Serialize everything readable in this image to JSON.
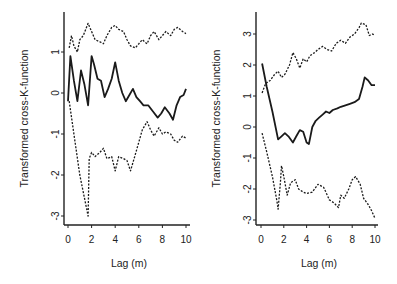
{
  "chart_data": [
    {
      "type": "line",
      "title": "",
      "xlabel": "Lag (m)",
      "ylabel": "Transformed cross-K-function",
      "xlim": [
        0,
        10
      ],
      "ylim": [
        -3.2,
        1.9
      ],
      "xticks": [
        0,
        2,
        4,
        6,
        8,
        10
      ],
      "yticks": [
        -3,
        -2,
        -1,
        0,
        1
      ],
      "grid": false,
      "legend": null,
      "series": [
        {
          "name": "upper envelope",
          "style": "dotted",
          "x": [
            0.1,
            0.3,
            0.5,
            0.8,
            1.0,
            1.3,
            1.7,
            2.0,
            2.3,
            2.7,
            3.0,
            3.3,
            3.7,
            4.0,
            4.3,
            4.7,
            5.0,
            5.3,
            5.7,
            6.0,
            6.3,
            6.7,
            7.0,
            7.3,
            7.7,
            8.0,
            8.3,
            8.7,
            9.0,
            9.3,
            9.7,
            10.0
          ],
          "y": [
            1.1,
            1.4,
            1.15,
            1.0,
            1.3,
            1.4,
            1.7,
            1.5,
            1.3,
            1.25,
            1.2,
            1.4,
            1.6,
            1.65,
            1.55,
            1.5,
            1.3,
            1.15,
            1.1,
            1.2,
            1.3,
            1.2,
            1.4,
            1.5,
            1.3,
            1.4,
            1.5,
            1.4,
            1.55,
            1.6,
            1.5,
            1.45
          ]
        },
        {
          "name": "observed",
          "style": "solid",
          "x": [
            0.0,
            0.2,
            0.5,
            0.8,
            1.1,
            1.4,
            1.7,
            2.0,
            2.2,
            2.5,
            2.8,
            3.1,
            3.4,
            3.7,
            4.0,
            4.3,
            4.6,
            4.9,
            5.2,
            5.5,
            5.8,
            6.1,
            6.4,
            6.8,
            7.2,
            7.6,
            7.9,
            8.2,
            8.6,
            8.9,
            9.2,
            9.5,
            9.8,
            10.0
          ],
          "y": [
            -0.2,
            0.9,
            0.3,
            -0.2,
            0.55,
            0.2,
            -0.3,
            0.9,
            0.7,
            0.35,
            0.3,
            -0.1,
            0.1,
            0.35,
            0.75,
            0.3,
            0.0,
            -0.2,
            -0.05,
            0.1,
            -0.1,
            -0.2,
            -0.3,
            -0.3,
            -0.45,
            -0.6,
            -0.5,
            -0.35,
            -0.5,
            -0.65,
            -0.3,
            -0.1,
            -0.05,
            0.1
          ]
        },
        {
          "name": "lower envelope",
          "style": "dotted",
          "x": [
            0.1,
            0.5,
            1.0,
            1.7,
            1.8,
            2.0,
            2.3,
            2.7,
            3.0,
            3.3,
            3.7,
            4.0,
            4.3,
            4.7,
            5.0,
            5.3,
            5.7,
            6.0,
            6.3,
            6.7,
            7.0,
            7.3,
            7.7,
            8.0,
            8.3,
            8.7,
            9.0,
            9.3,
            9.7,
            10.0
          ],
          "y": [
            -0.2,
            -1.0,
            -2.0,
            -3.0,
            -1.6,
            -1.45,
            -1.55,
            -1.45,
            -1.35,
            -1.6,
            -1.55,
            -1.9,
            -1.55,
            -1.6,
            -1.65,
            -1.9,
            -1.5,
            -1.2,
            -0.9,
            -0.7,
            -0.9,
            -1.05,
            -0.85,
            -1.0,
            -0.95,
            -1.0,
            -1.15,
            -1.2,
            -1.05,
            -1.1
          ]
        }
      ]
    },
    {
      "type": "line",
      "title": "",
      "xlabel": "Lag (m)",
      "ylabel": "Transformed cross-K-function",
      "xlim": [
        0,
        10
      ],
      "ylim": [
        -3.1,
        3.6
      ],
      "xticks": [
        0,
        2,
        4,
        6,
        8,
        10
      ],
      "yticks": [
        -3,
        -2,
        -1,
        0,
        1,
        2,
        3
      ],
      "grid": false,
      "legend": null,
      "series": [
        {
          "name": "upper envelope",
          "style": "dotted",
          "x": [
            0.1,
            0.4,
            0.8,
            1.2,
            1.5,
            1.8,
            2.1,
            2.5,
            2.8,
            3.1,
            3.4,
            3.7,
            4.0,
            4.3,
            4.7,
            5.0,
            5.4,
            5.8,
            6.2,
            6.6,
            7.0,
            7.4,
            7.8,
            8.2,
            8.6,
            8.8,
            9.2,
            9.5,
            9.8,
            10.0
          ],
          "y": [
            1.1,
            1.4,
            1.5,
            1.7,
            1.8,
            1.6,
            1.7,
            2.0,
            2.4,
            2.2,
            1.9,
            2.2,
            2.1,
            2.3,
            2.4,
            2.5,
            2.6,
            2.5,
            2.45,
            2.7,
            2.8,
            2.7,
            2.9,
            3.0,
            3.2,
            3.35,
            3.3,
            2.95,
            3.0,
            2.95
          ]
        },
        {
          "name": "observed",
          "style": "solid",
          "x": [
            0.1,
            0.5,
            1.0,
            1.5,
            1.8,
            2.1,
            2.4,
            2.8,
            3.1,
            3.4,
            3.7,
            4.0,
            4.2,
            4.5,
            4.8,
            5.1,
            5.4,
            5.7,
            6.0,
            6.3,
            6.7,
            7.0,
            7.4,
            7.8,
            8.2,
            8.6,
            8.9,
            9.1,
            9.4,
            9.7,
            10.0
          ],
          "y": [
            2.05,
            1.3,
            0.5,
            -0.4,
            -0.3,
            -0.2,
            -0.3,
            -0.5,
            -0.3,
            -0.1,
            -0.15,
            -0.5,
            -0.55,
            0.0,
            0.2,
            0.3,
            0.4,
            0.5,
            0.45,
            0.55,
            0.6,
            0.65,
            0.7,
            0.75,
            0.8,
            0.9,
            1.3,
            1.6,
            1.5,
            1.35,
            1.35
          ]
        },
        {
          "name": "lower envelope",
          "style": "dotted",
          "x": [
            0.1,
            0.5,
            1.0,
            1.4,
            1.5,
            1.7,
            1.8,
            2.0,
            2.3,
            2.6,
            3.0,
            3.3,
            3.7,
            4.0,
            4.5,
            5.0,
            5.5,
            6.0,
            6.4,
            6.8,
            7.0,
            7.3,
            7.7,
            8.0,
            8.3,
            8.7,
            9.0,
            9.4,
            9.7,
            10.0
          ],
          "y": [
            -0.2,
            -0.8,
            -1.6,
            -2.4,
            -2.65,
            -1.8,
            -1.25,
            -1.6,
            -2.2,
            -1.8,
            -1.7,
            -2.0,
            -2.1,
            -2.15,
            -2.1,
            -1.85,
            -1.95,
            -2.35,
            -2.45,
            -2.6,
            -2.2,
            -2.3,
            -2.0,
            -1.7,
            -1.6,
            -1.85,
            -2.3,
            -2.5,
            -2.7,
            -2.95
          ]
        }
      ]
    }
  ],
  "panels": [
    {
      "ylabel": "Transformed cross-K-function",
      "xlabel": "Lag (m)",
      "xtick_labels": [
        "0",
        "2",
        "4",
        "6",
        "8",
        "10"
      ],
      "ytick_labels": [
        "-3",
        "-2",
        "-1",
        "0",
        "1"
      ]
    },
    {
      "ylabel": "Transformed cross-K-function",
      "xlabel": "Lag (m)",
      "xtick_labels": [
        "0",
        "2",
        "4",
        "6",
        "8",
        "10"
      ],
      "ytick_labels": [
        "-3",
        "-2",
        "-1",
        "0",
        "1",
        "2",
        "3"
      ]
    }
  ]
}
